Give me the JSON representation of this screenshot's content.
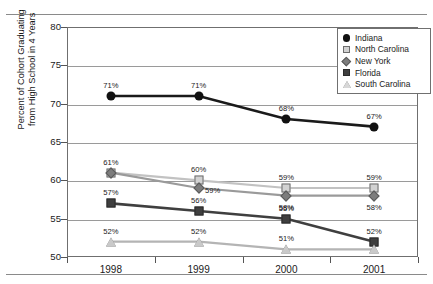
{
  "chart_data": {
    "type": "line",
    "title": "",
    "xlabel": "",
    "ylabel": "Percent of Cohort Graduating\nfrom High School in 4 Years",
    "categories": [
      "1998",
      "1999",
      "2000",
      "2001"
    ],
    "ylim": [
      50,
      80
    ],
    "ytick_labels": [
      "50",
      "55",
      "60",
      "65",
      "70",
      "75",
      "80"
    ],
    "ytick_values": [
      50,
      55,
      60,
      65,
      70,
      75,
      80
    ],
    "grid": true,
    "legend_position": "top-right",
    "value_suffix": "%",
    "series": [
      {
        "name": "Indiana",
        "marker": "circle",
        "color": "#111111",
        "line_color": "#1a1a1a",
        "values": [
          71,
          71,
          68,
          67
        ],
        "labels": [
          "71%",
          "71%",
          "68%",
          "67%"
        ],
        "label_positions": [
          "above",
          "above",
          "above",
          "above"
        ]
      },
      {
        "name": "North Carolina",
        "marker": "square-light",
        "color": "#d2d2d2",
        "line_color": "#c2c2c2",
        "values": [
          61,
          60,
          59,
          59
        ],
        "labels": [
          "61%",
          "60%",
          "59%",
          "59%"
        ],
        "label_positions": [
          "above",
          "above",
          "above",
          "above"
        ]
      },
      {
        "name": "New York",
        "marker": "diamond",
        "color": "#7d7d7d",
        "line_color": "#9a9a9a",
        "values": [
          61,
          59,
          58,
          58
        ],
        "labels": [
          "",
          "59%",
          "58%",
          "58%"
        ],
        "label_positions": [
          "",
          "right",
          "below",
          "below"
        ]
      },
      {
        "name": "Florida",
        "marker": "square-dark",
        "color": "#3f3f3f",
        "line_color": "#3f3f3f",
        "values": [
          57,
          56,
          55,
          52
        ],
        "labels": [
          "57%",
          "56%",
          "55%",
          "52%"
        ],
        "label_positions": [
          "above",
          "above",
          "above",
          "above"
        ]
      },
      {
        "name": "South Carolina",
        "marker": "triangle",
        "color": "#c9c9c9",
        "line_color": "#b4b4b4",
        "values": [
          52,
          52,
          51,
          51
        ],
        "labels": [
          "52%",
          "52%",
          "51%",
          ""
        ],
        "label_positions": [
          "above",
          "above",
          "above",
          ""
        ]
      }
    ]
  }
}
